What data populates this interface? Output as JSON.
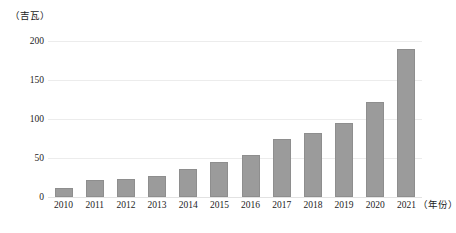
{
  "chart_data": {
    "type": "bar",
    "title": "",
    "subtitle": "",
    "xlabel": "（年份）",
    "ylabel": "（吉瓦）",
    "categories": [
      "2010",
      "2011",
      "2012",
      "2013",
      "2014",
      "2015",
      "2016",
      "2017",
      "2018",
      "2019",
      "2020",
      "2021"
    ],
    "values": [
      11,
      22,
      23,
      27,
      36,
      45,
      54,
      74,
      82,
      95,
      122,
      190
    ],
    "series": [
      {
        "name": "装机容量",
        "values": [
          11,
          22,
          23,
          27,
          36,
          45,
          54,
          74,
          82,
          95,
          122,
          190
        ]
      }
    ],
    "ylim": [
      0,
      200
    ],
    "y_ticks": [
      0,
      50,
      100,
      150,
      200
    ],
    "y_tick_labels": [
      "0",
      "50",
      "100",
      "150",
      "200"
    ],
    "grid": true,
    "legend": "none",
    "bar_color": "#9b9b9b",
    "bar_edge_color": "#8e8e8e",
    "gridline_color": "#ececec",
    "background_color": "#ffffff",
    "text_color": "#1c1c1c"
  },
  "axes": {
    "y_caption": "（吉瓦）",
    "x_unit_caption": "（年份）"
  }
}
